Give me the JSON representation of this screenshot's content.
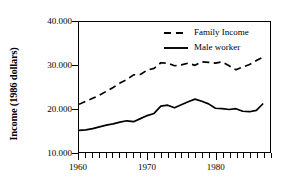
{
  "chart_data": {
    "type": "line",
    "title": "",
    "xlabel": "",
    "ylabel": "Income (1986 dollars)",
    "ylim": [
      10000,
      40000
    ],
    "xlim": [
      1960,
      1988
    ],
    "grid": false,
    "legend_position": "top-right",
    "ytick_labels": [
      "40.000",
      "30.000",
      "20.000",
      "10.000"
    ],
    "ytick_values": [
      40000,
      30000,
      20000,
      10000
    ],
    "xtick_labels": [
      "1960",
      "1970",
      "1980"
    ],
    "xtick_values": [
      1960,
      1970,
      1980
    ],
    "x_minor_tick_interval": 1,
    "x": [
      1960,
      1961,
      1962,
      1963,
      1964,
      1965,
      1966,
      1967,
      1968,
      1969,
      1970,
      1971,
      1972,
      1973,
      1974,
      1975,
      1976,
      1977,
      1978,
      1979,
      1980,
      1981,
      1982,
      1983,
      1984,
      1985,
      1986,
      1987
    ],
    "series": [
      {
        "name": "Family Income",
        "style": "dashed",
        "color": "#000000",
        "values": [
          21000,
          21700,
          22400,
          23100,
          24000,
          24900,
          25900,
          26700,
          27800,
          27900,
          28900,
          29300,
          30600,
          30500,
          29900,
          30100,
          30500,
          30000,
          30800,
          30700,
          30500,
          30800,
          29900,
          29000,
          29600,
          30200,
          31100,
          31900
        ]
      },
      {
        "name": "Male worker",
        "style": "solid",
        "color": "#000000",
        "values": [
          15000,
          15100,
          15400,
          15800,
          16200,
          16500,
          16900,
          17200,
          17000,
          17700,
          18400,
          18900,
          20600,
          20800,
          20200,
          20900,
          21600,
          22200,
          21700,
          21100,
          20100,
          20000,
          19800,
          20000,
          19400,
          19300,
          19600,
          21200
        ]
      }
    ]
  },
  "legend": {
    "items": [
      {
        "label": "Family Income",
        "style": "dashed"
      },
      {
        "label": "Male worker",
        "style": "solid"
      }
    ]
  }
}
